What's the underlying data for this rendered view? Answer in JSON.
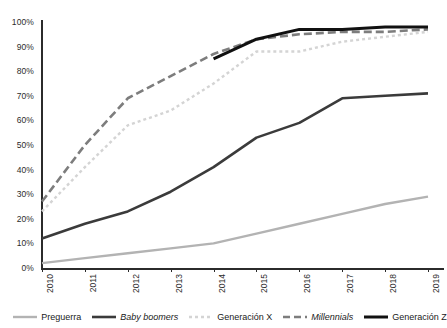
{
  "chart_data": {
    "type": "line",
    "title": "",
    "subtitle": "",
    "xlabel": "",
    "ylabel": "",
    "x": [
      "2010",
      "2011",
      "2012",
      "2013",
      "2014",
      "2015",
      "2016",
      "2017",
      "2018",
      "2019"
    ],
    "ylim": [
      0,
      100
    ],
    "y_ticks": [
      "0%",
      "10%",
      "20%",
      "30%",
      "40%",
      "50%",
      "60%",
      "70%",
      "80%",
      "90%",
      "100%"
    ],
    "y_tick_values": [
      0,
      10,
      20,
      30,
      40,
      50,
      60,
      70,
      80,
      90,
      100
    ],
    "grid": false,
    "legend_position": "bottom",
    "value_suffix": "%",
    "series": [
      {
        "name": "Preguerra",
        "style": "solid",
        "color": "#b3b3b3",
        "width": 2.4,
        "italic": false,
        "x": [
          "2010",
          "2011",
          "2012",
          "2013",
          "2014",
          "2015",
          "2016",
          "2017",
          "2018",
          "2019"
        ],
        "values": [
          2,
          4,
          6,
          8,
          10,
          14,
          18,
          22,
          26,
          29
        ]
      },
      {
        "name": "Baby boomers",
        "style": "solid",
        "color": "#3b3b3b",
        "width": 2.6,
        "italic": true,
        "x": [
          "2010",
          "2011",
          "2012",
          "2013",
          "2014",
          "2015",
          "2016",
          "2017",
          "2018",
          "2019"
        ],
        "values": [
          12,
          18,
          23,
          31,
          41,
          53,
          59,
          69,
          70,
          71
        ]
      },
      {
        "name": "Generación X",
        "style": "dotted",
        "color": "#d4d4d4",
        "width": 2.4,
        "italic": false,
        "x": [
          "2010",
          "2011",
          "2012",
          "2013",
          "2014",
          "2015",
          "2016",
          "2017",
          "2018",
          "2019"
        ],
        "values": [
          23,
          41,
          58,
          64,
          75,
          88,
          88,
          92,
          94,
          96
        ]
      },
      {
        "name": "Millennials",
        "style": "dashed",
        "color": "#7d7d7d",
        "width": 2.6,
        "italic": true,
        "x": [
          "2010",
          "2011",
          "2012",
          "2013",
          "2014",
          "2015",
          "2016",
          "2017",
          "2018",
          "2019"
        ],
        "values": [
          27,
          50,
          69,
          78,
          87,
          93,
          95,
          96,
          96,
          97
        ]
      },
      {
        "name": "Generación Z",
        "style": "solid",
        "color": "#111111",
        "width": 3.0,
        "italic": false,
        "x": [
          "2014",
          "2015",
          "2016",
          "2017",
          "2018",
          "2019"
        ],
        "values": [
          85,
          93,
          97,
          97,
          98,
          98
        ]
      }
    ]
  }
}
